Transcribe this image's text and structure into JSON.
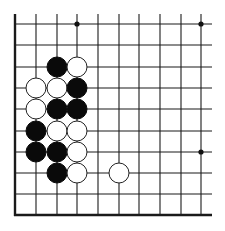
{
  "board": {
    "description": "Go (baduk) board fragment, lower-left corner region",
    "columns": 10,
    "rows": 10,
    "col_x": [
      15,
      36,
      57,
      77,
      98,
      119,
      139,
      160,
      181,
      201
    ],
    "row_y": [
      24,
      45,
      67,
      88,
      109,
      131,
      152,
      173,
      194,
      215
    ],
    "left_edge": true,
    "bottom_edge": true,
    "top_open": true,
    "right_open": true,
    "line_color": "#1a1a1a",
    "stone_radius": 10,
    "star_points": [
      {
        "col": 3,
        "row": 0
      },
      {
        "col": 9,
        "row": 0
      },
      {
        "col": 9,
        "row": 6
      }
    ],
    "stones": [
      {
        "color": "black",
        "col": 2,
        "row": 2
      },
      {
        "color": "white",
        "col": 3,
        "row": 2
      },
      {
        "color": "white",
        "col": 1,
        "row": 3
      },
      {
        "color": "white",
        "col": 2,
        "row": 3
      },
      {
        "color": "black",
        "col": 3,
        "row": 3
      },
      {
        "color": "white",
        "col": 1,
        "row": 4
      },
      {
        "color": "black",
        "col": 2,
        "row": 4
      },
      {
        "color": "black",
        "col": 3,
        "row": 4
      },
      {
        "color": "black",
        "col": 1,
        "row": 5
      },
      {
        "color": "white",
        "col": 2,
        "row": 5
      },
      {
        "color": "white",
        "col": 3,
        "row": 5
      },
      {
        "color": "black",
        "col": 1,
        "row": 6
      },
      {
        "color": "black",
        "col": 2,
        "row": 6
      },
      {
        "color": "white",
        "col": 3,
        "row": 6
      },
      {
        "color": "black",
        "col": 2,
        "row": 7
      },
      {
        "color": "white",
        "col": 3,
        "row": 7
      },
      {
        "color": "white",
        "col": 5,
        "row": 7
      }
    ]
  }
}
